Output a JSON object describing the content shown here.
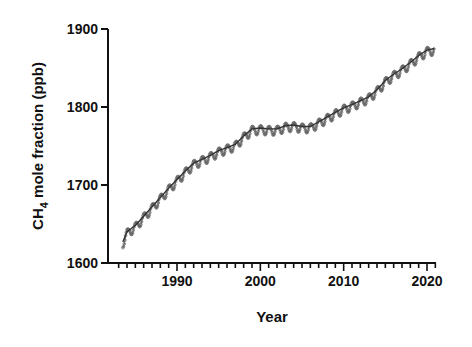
{
  "chart_data": {
    "type": "line",
    "title": "",
    "xlabel": "Year",
    "ylabel": "CH4 mole fraction (ppb)",
    "ylabel_parts": {
      "main": "CH",
      "subscript": "4",
      "rest": " mole fraction (ppb)"
    },
    "xlim": [
      1982,
      2021
    ],
    "ylim": [
      1600,
      1900
    ],
    "x_ticks": [
      1990,
      2000,
      2010,
      2020
    ],
    "y_ticks": [
      1600,
      1700,
      1800,
      1900
    ],
    "x_minor_tick_step": 1,
    "grid": false,
    "legend": null,
    "series": [
      {
        "name": "Monthly mean (seasonal cycle)",
        "style": "markers-with-line",
        "color": "#555555",
        "seasonal_amplitude_ppb": 8
      },
      {
        "name": "Deseasonalized trend",
        "style": "line",
        "color": "#333333"
      }
    ],
    "x": [
      1983.5,
      1984,
      1985,
      1986,
      1987,
      1988,
      1989,
      1990,
      1991,
      1992,
      1993,
      1994,
      1995,
      1996,
      1997,
      1998,
      1999,
      2000,
      2001,
      2002,
      2003,
      2004,
      2005,
      2006,
      2007,
      2008,
      2009,
      2010,
      2011,
      2012,
      2013,
      2014,
      2015,
      2016,
      2017,
      2018,
      2019,
      2020,
      2020.9
    ],
    "values": [
      1627,
      1640,
      1648,
      1660,
      1672,
      1684,
      1696,
      1707,
      1718,
      1728,
      1733,
      1738,
      1744,
      1748,
      1752,
      1763,
      1772,
      1773,
      1772,
      1772,
      1776,
      1777,
      1775,
      1775,
      1781,
      1787,
      1793,
      1799,
      1803,
      1808,
      1813,
      1822,
      1834,
      1842,
      1849,
      1857,
      1866,
      1873,
      1875
    ]
  },
  "plot": {
    "left": 108,
    "right": 436,
    "top": 29,
    "bottom": 263,
    "axis_color": "#111111"
  }
}
